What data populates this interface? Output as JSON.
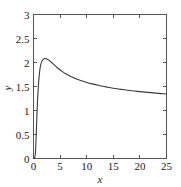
{
  "chart_data": {
    "type": "line",
    "title": "",
    "xlabel": "x",
    "ylabel": "y",
    "xlim": [
      0,
      25
    ],
    "ylim": [
      0,
      3
    ],
    "xticks": [
      0,
      5,
      10,
      15,
      20,
      25
    ],
    "yticks": [
      0,
      0.5,
      1,
      1.5,
      2,
      2.5,
      3
    ],
    "xticklabels": [
      "0",
      "5",
      "10",
      "15",
      "20",
      "25"
    ],
    "yticklabels": [
      "0",
      "0.5",
      "1",
      "1.5",
      "2",
      "2.5",
      "3"
    ],
    "grid": false,
    "legend": null,
    "line_color": "#3a3a3a",
    "frame_color": "#555555",
    "background_color": "#ffffff",
    "series": [
      {
        "name": "curve",
        "x": [
          0.0,
          0.2,
          0.35,
          0.45,
          0.55,
          0.65,
          0.75,
          0.9,
          1.05,
          1.2,
          1.4,
          1.6,
          1.8,
          2.0,
          2.2,
          2.4,
          2.6,
          2.8,
          3.0,
          3.4,
          3.8,
          4.2,
          4.6,
          5.0,
          5.5,
          6.0,
          6.5,
          7.0,
          7.5,
          8.0,
          9.0,
          10.0,
          11.0,
          12.0,
          13.0,
          14.0,
          15.0,
          16.0,
          17.0,
          18.0,
          19.0,
          20.0,
          21.0,
          22.0,
          23.0,
          24.0,
          25.0
        ],
        "y": [
          0.0,
          0.02,
          0.1,
          0.32,
          0.62,
          0.92,
          1.18,
          1.48,
          1.7,
          1.85,
          1.97,
          2.03,
          2.06,
          2.08,
          2.082,
          2.078,
          2.07,
          2.055,
          2.04,
          2.0,
          1.96,
          1.92,
          1.88,
          1.845,
          1.805,
          1.77,
          1.74,
          1.71,
          1.685,
          1.66,
          1.62,
          1.585,
          1.555,
          1.53,
          1.505,
          1.485,
          1.465,
          1.448,
          1.432,
          1.418,
          1.405,
          1.393,
          1.382,
          1.372,
          1.362,
          1.352,
          1.343
        ]
      }
    ]
  },
  "axes": {
    "x_title": "x",
    "y_title": "y"
  }
}
